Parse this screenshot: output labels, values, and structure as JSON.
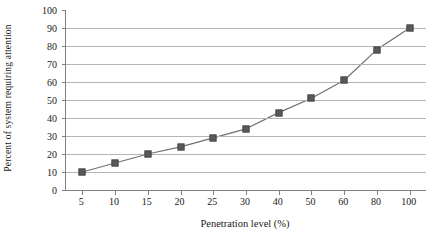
{
  "chart_data": {
    "type": "line",
    "title": "",
    "subtitle": "",
    "xlabel": "Penetration level (%)",
    "ylabel": "Percent of system requiring attention",
    "categories": [
      "5",
      "10",
      "15",
      "20",
      "25",
      "30",
      "40",
      "50",
      "60",
      "80",
      "100"
    ],
    "values": [
      10,
      15,
      20,
      24,
      29,
      34,
      43,
      51,
      61,
      78,
      90
    ],
    "series": [
      {
        "name": "Percent of system requiring attention",
        "values": [
          10,
          15,
          20,
          24,
          29,
          34,
          43,
          51,
          61,
          78,
          90
        ],
        "marker": "square",
        "marker_color": "#595959",
        "line_color": "#707070"
      }
    ],
    "ylim": [
      0,
      100
    ],
    "yticks": [
      0,
      10,
      20,
      30,
      40,
      50,
      60,
      70,
      80,
      90,
      100
    ],
    "ytick_labels": [
      "0",
      "10",
      "20",
      "30",
      "40",
      "50",
      "60",
      "70",
      "80",
      "90",
      "100"
    ],
    "xtick_labels": [
      "5",
      "10",
      "15",
      "20",
      "25",
      "30",
      "40",
      "50",
      "60",
      "80",
      "100"
    ],
    "grid": "horizontal",
    "gridline_values": [
      10,
      20,
      30,
      40,
      50,
      60,
      70,
      80,
      90
    ],
    "legend": "none",
    "legend_position": "none",
    "axis_color": "#808080",
    "grid_color": "#b5b5b5",
    "background": "#ffffff"
  }
}
